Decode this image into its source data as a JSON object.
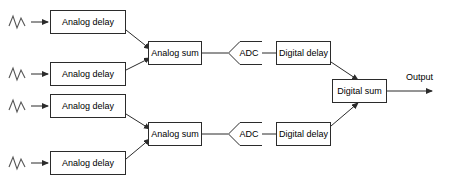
{
  "diagram": {
    "background_color": "#ffffff",
    "line_color": "#2b2b2b",
    "text_color": "#000000",
    "channels": [
      {
        "id": "ch1",
        "source_icon": "sine-wave-icon",
        "delay_label": "Analog delay"
      },
      {
        "id": "ch2",
        "source_icon": "sine-wave-icon",
        "delay_label": "Analog delay"
      },
      {
        "id": "ch3",
        "source_icon": "sine-wave-icon",
        "delay_label": "Analog delay"
      },
      {
        "id": "ch4",
        "source_icon": "sine-wave-icon",
        "delay_label": "Analog delay"
      }
    ],
    "analog_sums": [
      {
        "id": "asum-top",
        "label": "Analog sum"
      },
      {
        "id": "asum-bottom",
        "label": "Analog sum"
      }
    ],
    "adcs": [
      {
        "id": "adc-top",
        "label": "ADC"
      },
      {
        "id": "adc-bottom",
        "label": "ADC"
      }
    ],
    "digital_delays": [
      {
        "id": "ddelay-top",
        "label": "Digital delay"
      },
      {
        "id": "ddelay-bottom",
        "label": "Digital delay"
      }
    ],
    "digital_sum": {
      "id": "dsum",
      "label": "Digital sum"
    },
    "output": {
      "label": "Output"
    }
  }
}
